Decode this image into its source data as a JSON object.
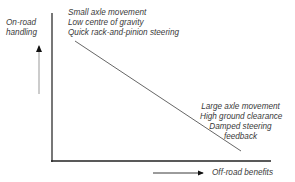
{
  "diagram": {
    "y_axis_label_lines": [
      "On-road",
      "handling"
    ],
    "x_axis_label": "Off-road benefits",
    "high_on_road_features": [
      "Small axle movement",
      "Low centre of gravity",
      "Quick rack-and-pinion steering"
    ],
    "high_off_road_features": [
      "Large axle movement",
      "High ground clearance",
      "Damped steering",
      "feedback"
    ],
    "relationship": "inverse trade-off: as off-road benefits increase, on-road handling decreases"
  }
}
